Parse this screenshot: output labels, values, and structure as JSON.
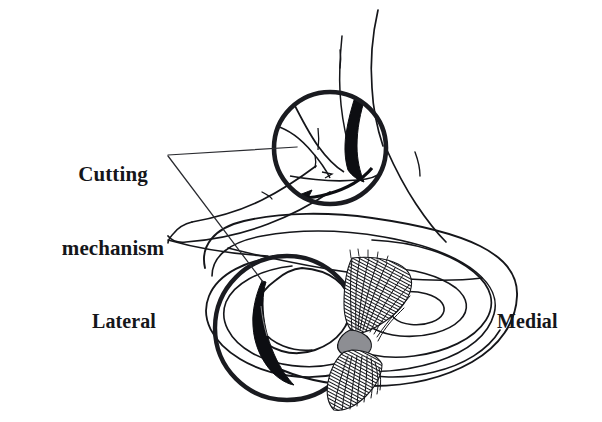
{
  "figure": {
    "background_color": "#ffffff",
    "ink_color": "#111217",
    "width": 602,
    "height": 422
  },
  "labels": {
    "cutting_mechanism": "Cutting\nmechanism",
    "cutting_mechanism_line1": "Cutting",
    "cutting_mechanism_line2": "mechanism",
    "lateral": "Lateral",
    "medial": "Medial"
  },
  "callouts": {
    "leader_upper": "leader-line-to-knee-inset",
    "leader_lower": "leader-line-to-meniscus-inset"
  },
  "insets": {
    "knee_flexion": {
      "name": "knee-flexion-inset",
      "center_x": 330,
      "center_y": 148,
      "radius": 57,
      "contents": [
        "femur-contour",
        "tibia-contour",
        "black-wedge",
        "rotation-arrow"
      ]
    },
    "meniscus_tear": {
      "name": "meniscus-tear-inset",
      "center_x": 287,
      "center_y": 328,
      "radius": 73,
      "contents": [
        "lateral-meniscus-rings",
        "black-crescent-tear"
      ]
    }
  },
  "anatomy": {
    "tibial_plateau": "tibial-plateau-outline",
    "lateral_meniscus": "lateral-meniscus",
    "medial_meniscus": "medial-meniscus",
    "cruciate_fibers": "cruciate-ligament-fibers",
    "tear_fragment": "displaced-meniscal-fragment"
  }
}
